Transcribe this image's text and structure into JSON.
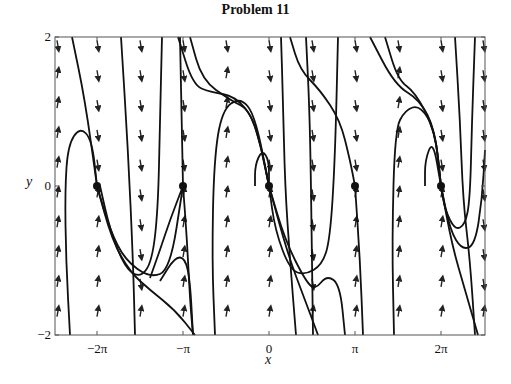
{
  "chart_data": {
    "type": "line",
    "subtype": "phase-portrait",
    "title": "Problem 11",
    "xlabel": "x",
    "ylabel": "y",
    "xlim": [
      -7.82,
      7.89
    ],
    "ylim": [
      -2,
      2
    ],
    "grid": false,
    "legend": null,
    "x_ticks": [
      {
        "value": -6.2832,
        "label": "−2π"
      },
      {
        "value": -3.1416,
        "label": "−π"
      },
      {
        "value": 0,
        "label": "0"
      },
      {
        "value": 3.1416,
        "label": "π"
      },
      {
        "value": 6.2832,
        "label": "2π"
      }
    ],
    "y_ticks": [
      {
        "value": -2,
        "label": "−2"
      },
      {
        "value": 0,
        "label": "0"
      },
      {
        "value": 2,
        "label": "2"
      }
    ],
    "equilibria": [
      {
        "x": -6.2832,
        "y": 0,
        "type": "stable"
      },
      {
        "x": -3.1416,
        "y": 0,
        "type": "saddle"
      },
      {
        "x": 0,
        "y": 0,
        "type": "stable"
      },
      {
        "x": 3.1416,
        "y": 0,
        "type": "saddle"
      },
      {
        "x": 6.2832,
        "y": 0,
        "type": "stable"
      }
    ],
    "direction_field": {
      "columns_x": [
        -7.85,
        -6.2832,
        -4.7124,
        -3.1416,
        -1.5708,
        0,
        1.5708,
        3.1416,
        4.7124,
        6.2832,
        7.85
      ],
      "rows_y": [
        1.9,
        1.5,
        1.1,
        0.7,
        0.3,
        -0.1,
        -0.5,
        -0.9,
        -1.3,
        -1.7,
        -2.0
      ],
      "note": "mostly vertical arrows; downward near x=−π/2+2kπ with y>0 regions, upward near x=−π/2, 3π/2 columns"
    }
  },
  "figure": {
    "frame": {
      "left": 55,
      "top": 37,
      "right": 485,
      "bottom": 335
    },
    "origin_px": {
      "x": 269,
      "y": 186
    },
    "scale_px": {
      "x_per_pi": 86,
      "y_per_unit": 74.5
    },
    "x_tick_labels": [
      {
        "px": 97,
        "text": "−2π"
      },
      {
        "px": 183,
        "text": "−π"
      },
      {
        "px": 269,
        "text": "0"
      },
      {
        "px": 355,
        "text": "π"
      },
      {
        "px": 441,
        "text": "2π"
      }
    ],
    "y_tick_labels": [
      {
        "py": 37,
        "text": "2"
      },
      {
        "py": 186,
        "text": "0"
      },
      {
        "py": 335,
        "text": "−2"
      }
    ],
    "trajectories": [
      [
        [
          72,
          37
        ],
        [
          85,
          100
        ],
        [
          97,
          186
        ]
      ],
      [
        [
          70,
          335
        ],
        [
          66,
          260
        ],
        [
          65,
          190
        ],
        [
          68,
          145
        ],
        [
          80,
          127
        ],
        [
          92,
          140
        ],
        [
          97,
          186
        ]
      ],
      [
        [
          100,
          186
        ],
        [
          110,
          230
        ],
        [
          125,
          268
        ],
        [
          140,
          278
        ],
        [
          152,
          262
        ],
        [
          158,
          210
        ],
        [
          160,
          120
        ],
        [
          162,
          37
        ]
      ],
      [
        [
          97,
          186
        ],
        [
          110,
          230
        ],
        [
          125,
          260
        ],
        [
          150,
          278
        ],
        [
          170,
          270
        ],
        [
          183,
          186
        ]
      ],
      [
        [
          97,
          186
        ],
        [
          112,
          240
        ],
        [
          130,
          272
        ],
        [
          150,
          290
        ],
        [
          175,
          310
        ],
        [
          195,
          335
        ]
      ],
      [
        [
          183,
          186
        ],
        [
          170,
          220
        ],
        [
          160,
          250
        ],
        [
          150,
          278
        ]
      ],
      [
        [
          183,
          186
        ],
        [
          187,
          240
        ],
        [
          190,
          300
        ],
        [
          193,
          335
        ]
      ],
      [
        [
          160,
          281
        ],
        [
          175,
          257
        ],
        [
          185,
          258
        ],
        [
          190,
          280
        ],
        [
          193,
          335
        ]
      ],
      [
        [
          121,
          37
        ],
        [
          128,
          150
        ],
        [
          133,
          260
        ],
        [
          135,
          335
        ]
      ],
      [
        [
          180,
          37
        ],
        [
          183,
          186
        ]
      ],
      [
        [
          190,
          37
        ],
        [
          202,
          80
        ],
        [
          230,
          100
        ],
        [
          250,
          110
        ],
        [
          262,
          150
        ],
        [
          269,
          186
        ]
      ],
      [
        [
          178,
          37
        ],
        [
          193,
          85
        ],
        [
          210,
          92
        ],
        [
          235,
          96
        ],
        [
          255,
          120
        ],
        [
          269,
          186
        ]
      ],
      [
        [
          215,
          335
        ],
        [
          212,
          260
        ],
        [
          214,
          160
        ],
        [
          222,
          110
        ],
        [
          240,
          97
        ],
        [
          255,
          115
        ],
        [
          269,
          186
        ]
      ],
      [
        [
          255,
          186
        ],
        [
          255,
          165
        ],
        [
          262,
          150
        ],
        [
          269,
          160
        ],
        [
          269,
          186
        ]
      ],
      [
        [
          269,
          186
        ],
        [
          275,
          230
        ],
        [
          290,
          270
        ],
        [
          305,
          275
        ],
        [
          322,
          265
        ],
        [
          330,
          240
        ],
        [
          335,
          160
        ],
        [
          338,
          37
        ]
      ],
      [
        [
          269,
          186
        ],
        [
          285,
          240
        ],
        [
          305,
          280
        ],
        [
          315,
          290
        ],
        [
          327,
          275
        ],
        [
          340,
          285
        ],
        [
          345,
          335
        ]
      ],
      [
        [
          269,
          186
        ],
        [
          288,
          255
        ],
        [
          305,
          300
        ],
        [
          318,
          335
        ]
      ],
      [
        [
          281,
          37
        ],
        [
          283,
          100
        ],
        [
          285,
          186
        ],
        [
          290,
          260
        ],
        [
          296,
          335
        ]
      ],
      [
        [
          306,
          37
        ],
        [
          310,
          120
        ],
        [
          312,
          260
        ],
        [
          313,
          335
        ]
      ],
      [
        [
          355,
          186
        ],
        [
          350,
          160
        ],
        [
          340,
          120
        ],
        [
          320,
          90
        ],
        [
          300,
          70
        ],
        [
          290,
          37
        ]
      ],
      [
        [
          355,
          186
        ],
        [
          360,
          260
        ],
        [
          363,
          335
        ]
      ],
      [
        [
          370,
          37
        ],
        [
          395,
          85
        ],
        [
          420,
          100
        ],
        [
          435,
          130
        ],
        [
          441,
          186
        ]
      ],
      [
        [
          385,
          37
        ],
        [
          398,
          80
        ],
        [
          415,
          92
        ],
        [
          435,
          130
        ],
        [
          441,
          186
        ]
      ],
      [
        [
          394,
          335
        ],
        [
          392,
          240
        ],
        [
          395,
          130
        ],
        [
          405,
          110
        ],
        [
          420,
          105
        ],
        [
          435,
          130
        ],
        [
          441,
          186
        ]
      ],
      [
        [
          425,
          186
        ],
        [
          425,
          160
        ],
        [
          433,
          140
        ],
        [
          441,
          186
        ]
      ],
      [
        [
          441,
          186
        ],
        [
          445,
          210
        ],
        [
          455,
          230
        ],
        [
          465,
          225
        ],
        [
          470,
          200
        ],
        [
          472,
          120
        ],
        [
          475,
          37
        ]
      ],
      [
        [
          441,
          186
        ],
        [
          450,
          230
        ],
        [
          462,
          250
        ],
        [
          475,
          245
        ],
        [
          482,
          200
        ],
        [
          485,
          150
        ]
      ],
      [
        [
          441,
          186
        ],
        [
          452,
          245
        ],
        [
          465,
          290
        ],
        [
          478,
          335
        ]
      ],
      [
        [
          455,
          37
        ],
        [
          460,
          120
        ],
        [
          463,
          200
        ],
        [
          470,
          260
        ],
        [
          475,
          335
        ]
      ]
    ]
  }
}
